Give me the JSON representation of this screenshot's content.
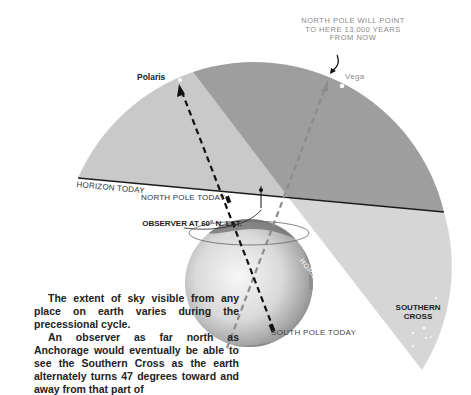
{
  "labels": {
    "polaris": "Polaris",
    "vega": "Vega",
    "future_note": "NORTH POLE WILL POINT TO HERE 13,000 YEARS FROM NOW",
    "horizon_today": "HORIZON TODAY",
    "north_pole_today": "NORTH POLE TODAY",
    "observer": "OBSERVER AT 60° N. LAT.",
    "south_pole_today": "SOUTH POLE TODAY",
    "horizon_future": "HORIZON 13,000 YEARS FROM NOW",
    "southern_cross": "SOUTHERN CROSS"
  },
  "caption": {
    "paragraph1": "The extent of sky visible from any place on earth varies during the precessional cycle.",
    "paragraph2": "An observer as far north as Anchorage would eventually be able to see the Southern Cross as the earth alternately turns 47 degrees toward and away from that part of"
  },
  "colors": {
    "sky_today_only": "#c9c9c9",
    "sky_both": "#9e9e9e",
    "sky_future_only": "#d6d6d6",
    "horizon_line": "#1a1a1a",
    "axis_today": "#111111",
    "axis_future": "#8c8c8c"
  }
}
